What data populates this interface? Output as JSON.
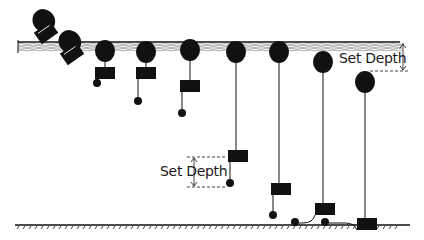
{
  "colors": {
    "ink": "#111111",
    "water": "#555555",
    "background": "#ffffff"
  },
  "labels": {
    "set_depth_surface": "Set Depth",
    "set_depth_mid": "Set Depth"
  },
  "surface": {
    "y": 45,
    "x1": 18,
    "x2": 400
  },
  "seabed": {
    "y": 225,
    "x1": 15,
    "x2": 410
  },
  "floats": [
    {
      "id": 1,
      "cx": 44,
      "cy": 28,
      "tilted": true,
      "angle": -35
    },
    {
      "id": 2,
      "cx": 70,
      "cy": 49,
      "tilted": true,
      "angle": -35
    },
    {
      "id": 3,
      "cx": 105,
      "cy": 51,
      "weight_y": 67,
      "ball_y": 83,
      "line_to_ball": true
    },
    {
      "id": 4,
      "cx": 146,
      "cy": 52,
      "weight_y": 67,
      "ball_y": 101
    },
    {
      "id": 5,
      "cx": 190,
      "cy": 50,
      "weight_y": 80,
      "ball_y": 113
    },
    {
      "id": 6,
      "cx": 236,
      "cy": 52,
      "weight_y": 150,
      "ball_y": 183
    },
    {
      "id": 7,
      "cx": 279,
      "cy": 52,
      "weight_y": 183,
      "ball_y": 215
    },
    {
      "id": 8,
      "cx": 323,
      "cy": 62,
      "weight_y": 203,
      "ball_y": 223,
      "curled": true
    },
    {
      "id": 9,
      "cx": 365,
      "cy": 82,
      "weight_y": 218,
      "ball_y": 223,
      "curled": true,
      "rest": true
    }
  ]
}
